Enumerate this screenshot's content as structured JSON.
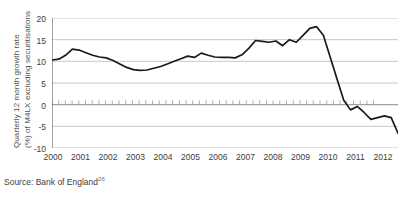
{
  "chart_data": {
    "type": "line",
    "title": "",
    "xlabel": "",
    "ylabel": "Quarterly 12 month growth rate (%) of M4LX excluding securitisations",
    "ylabel_line1": "Quarterly 12 month growth rate",
    "ylabel_line2": "(%) of M4LX excluding securitisations",
    "xlim": [
      2000,
      2012.75
    ],
    "ylim": [
      -10,
      20
    ],
    "yticks": [
      20,
      15,
      10,
      5,
      0,
      -5,
      -10
    ],
    "xticks": [
      2000,
      2001,
      2002,
      2003,
      2004,
      2005,
      2006,
      2007,
      2008,
      2009,
      2010,
      2011,
      2012
    ],
    "grid": true,
    "gridlines_y": [
      20,
      15,
      10,
      5,
      0,
      -5,
      -10
    ],
    "zero_line": 0,
    "legend": "none",
    "series": [
      {
        "name": "M4LX excluding securitisations",
        "color": "#1a1a1a",
        "x": [
          2000.0,
          2000.25,
          2000.5,
          2000.75,
          2001.0,
          2001.25,
          2001.5,
          2001.75,
          2002.0,
          2002.25,
          2002.5,
          2002.75,
          2003.0,
          2003.25,
          2003.5,
          2003.75,
          2004.0,
          2004.25,
          2004.5,
          2004.75,
          2005.0,
          2005.25,
          2005.5,
          2005.75,
          2006.0,
          2006.25,
          2006.5,
          2006.75,
          2007.0,
          2007.25,
          2007.5,
          2007.75,
          2008.0,
          2008.25,
          2008.5,
          2008.75,
          2009.0,
          2009.25,
          2009.5,
          2009.75,
          2010.0,
          2010.25,
          2010.5,
          2010.75,
          2011.0,
          2011.25,
          2011.5,
          2011.75,
          2012.0,
          2012.25,
          2012.5
        ],
        "values": [
          10.3,
          10.5,
          11.4,
          12.8,
          12.6,
          12.0,
          11.4,
          11.0,
          10.8,
          10.2,
          9.4,
          8.6,
          8.1,
          7.9,
          8.0,
          8.4,
          8.8,
          9.4,
          10.0,
          10.6,
          11.2,
          10.9,
          11.9,
          11.4,
          11.0,
          10.9,
          10.9,
          10.8,
          11.5,
          13.0,
          14.8,
          14.6,
          14.4,
          14.7,
          13.6,
          15.0,
          14.4,
          16.0,
          17.6,
          18.0,
          16.0,
          11.0,
          6.0,
          1.0,
          -1.2,
          -0.4,
          -1.8,
          -3.4,
          -3.0,
          -2.6,
          -3.0
        ],
        "tail_x": [
          2012.5,
          2012.75
        ],
        "tail_values": [
          -3.0,
          -6.6
        ]
      }
    ],
    "key_points": {
      "start": {
        "x": 2000.0,
        "y": 10.3
      },
      "early_peak": {
        "x": 2001.0,
        "y": 12.8
      },
      "trough_2003": {
        "x": 2003.25,
        "y": 7.9
      },
      "peak_2009": {
        "x": 2009.75,
        "y": 18.0
      },
      "crossed_zero": {
        "x": 2010.8,
        "y": 0
      },
      "end": {
        "x": 2012.75,
        "y": -6.6
      }
    },
    "source": "Source: Bank of England",
    "source_footnote": "26"
  }
}
